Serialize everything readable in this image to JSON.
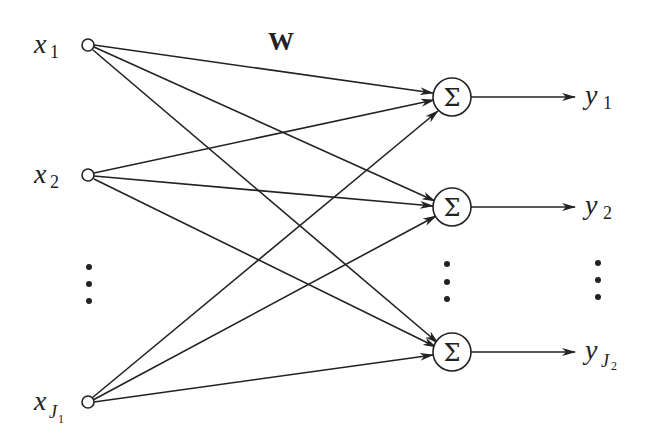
{
  "diagram": {
    "weight_label": "W",
    "inputs": [
      {
        "var": "x",
        "sub": "1",
        "subsub": ""
      },
      {
        "var": "x",
        "sub": "2",
        "subsub": ""
      },
      {
        "var": "x",
        "sub": "J",
        "subsub": "1"
      }
    ],
    "outputs": [
      {
        "var": "y",
        "sub": "1",
        "subsub": ""
      },
      {
        "var": "y",
        "sub": "2",
        "subsub": ""
      },
      {
        "var": "y",
        "sub": "J",
        "subsub": "2"
      }
    ],
    "sum_symbol": "Σ",
    "ellipsis": "⋮"
  }
}
